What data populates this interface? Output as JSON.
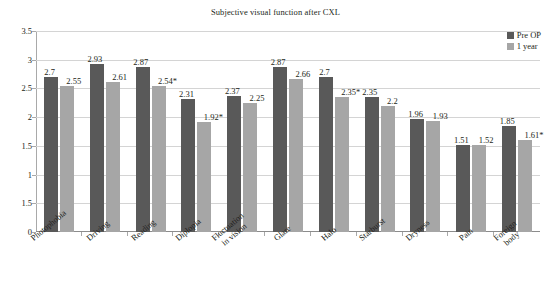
{
  "chart_data": {
    "type": "bar",
    "title": "Subjective visual function after CXL",
    "xlabel": "",
    "ylabel": "",
    "ylim": [
      0,
      3.5
    ],
    "ytick_values": [
      3.5,
      3,
      2.5,
      2,
      1.5,
      1,
      0.5,
      0
    ],
    "ytick_labels": [
      "3.5",
      "3",
      "2.5",
      "2",
      "1.5",
      "1",
      "1.5",
      "0"
    ],
    "grid": true,
    "legend_position": "top-right",
    "categories": [
      "Photophobia",
      "Driving",
      "Reading",
      "Diplopia",
      "Fluctuation\nin vision",
      "Glare",
      "Halo",
      "Starburst",
      "Dryness",
      "Pain",
      "Foreign\nbody"
    ],
    "series": [
      {
        "name": "Pre OP",
        "color": "#595959",
        "values": [
          2.7,
          2.93,
          2.87,
          2.31,
          2.37,
          2.87,
          2.7,
          2.35,
          1.96,
          1.51,
          1.85
        ],
        "labels": [
          "2.7",
          "2.93",
          "2.87",
          "2.31",
          "2.37",
          "2.87",
          "2.7",
          "2.35",
          "1.96",
          "1.51",
          "1.85"
        ]
      },
      {
        "name": "1 year",
        "color": "#a6a6a6",
        "values": [
          2.55,
          2.61,
          2.54,
          1.92,
          2.25,
          2.66,
          2.35,
          2.2,
          1.93,
          1.52,
          1.61
        ],
        "labels": [
          "2.55",
          "2.61",
          "2.54*",
          "1.92*",
          "2.25",
          "2.66",
          "2.35*",
          "2.2",
          "1.93",
          "1.52",
          "1.61*"
        ]
      }
    ]
  }
}
